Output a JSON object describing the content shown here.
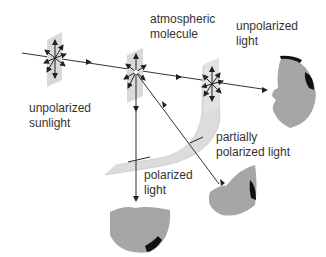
{
  "labels": {
    "sunlight": [
      "unpolarized",
      "sunlight"
    ],
    "molecule": [
      "atmospheric",
      "molecule"
    ],
    "unpolarized": [
      "unpolarized",
      "light"
    ],
    "partial": [
      "partially",
      "polarized light"
    ],
    "polarized": [
      "polarized",
      "light"
    ]
  },
  "colors": {
    "plane": "#d9d9d9",
    "arrow": "#222222",
    "face": "#a6a6a6",
    "hair": "#111111",
    "text": "#333333"
  }
}
